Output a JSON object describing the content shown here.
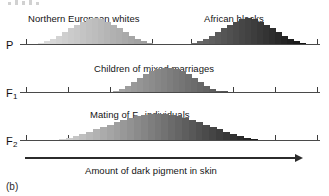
{
  "figure": {
    "panel_label": "(b)",
    "axis_title": "Amount of dark pigment in skin",
    "background": "#ffffff",
    "ink": "#1a1a1a"
  },
  "rows": [
    {
      "id": "P",
      "label": "P",
      "label_sub": "",
      "captions": [
        {
          "text": "Northern European whites",
          "x": 28,
          "y": 14
        },
        {
          "text": "African blacks",
          "x": 204,
          "y": 14
        }
      ]
    },
    {
      "id": "F1",
      "label": "F",
      "label_sub": "1",
      "captions": [
        {
          "text": "Children of mixed marriages",
          "x": 94,
          "y": 64
        }
      ]
    },
    {
      "id": "F2",
      "label": "F",
      "label_sub": "2",
      "captions": [
        {
          "text": "Mating of F",
          "suffix_sub": "1",
          "suffix": " individuals",
          "x": 90,
          "y": 114
        }
      ]
    }
  ],
  "chart_data": {
    "type": "bar",
    "xlabel": "Amount of dark pigment in skin",
    "ylabel": "Frequency",
    "grid": false,
    "legend": "none",
    "xlim": [
      0,
      100
    ],
    "note": "Grayscale fill encodes pigment amount: light (low) to dark (high)",
    "panels": [
      {
        "name": "P",
        "generation": "P",
        "series": [
          {
            "name": "Northern European whites",
            "x_start": 6,
            "x_end": 44,
            "shade_start": "#dedede",
            "shade_end": "#9b9b9b",
            "values": [
              1,
              2,
              4,
              6,
              9,
              12,
              15,
              17,
              19,
              20,
              19,
              17,
              15,
              12,
              9,
              6,
              4,
              2,
              1
            ]
          },
          {
            "name": "African blacks",
            "x_start": 57,
            "x_end": 95,
            "shade_start": "#6e6e6e",
            "shade_end": "#151515",
            "values": [
              1,
              2,
              4,
              6,
              9,
              12,
              15,
              17,
              19,
              20,
              19,
              17,
              15,
              12,
              9,
              6,
              4,
              2,
              1
            ]
          }
        ],
        "ticks": [
          2,
          16,
          30,
          44,
          57,
          71,
          85,
          99
        ]
      },
      {
        "name": "F1",
        "generation": "F1",
        "series": [
          {
            "name": "Children of mixed marriages",
            "x_start": 31,
            "x_end": 69,
            "shade_start": "#a7a7a7",
            "shade_end": "#555555",
            "values": [
              1,
              3,
              6,
              10,
              14,
              18,
              21,
              23,
              24,
              24,
              23,
              21,
              18,
              14,
              10,
              6,
              3,
              1,
              1
            ]
          }
        ],
        "ticks": [
          2,
          16,
          30,
          44,
          57,
          71,
          85,
          99
        ]
      },
      {
        "name": "F2",
        "generation": "F2",
        "series": [
          {
            "name": "Mating of F1 individuals",
            "x_start": 13,
            "x_end": 79,
            "shade_start": "#d2d2d2",
            "shade_end": "#1e1e1e",
            "values": [
              1,
              2,
              3,
              5,
              7,
              9,
              11,
              13,
              15,
              17,
              19,
              20,
              21,
              22,
              22,
              22,
              21,
              20,
              19,
              17,
              15,
              13,
              11,
              9,
              7,
              5,
              3,
              2,
              1
            ]
          }
        ],
        "ticks": [
          2,
          16,
          30,
          44,
          57,
          71,
          85,
          99
        ]
      }
    ]
  }
}
